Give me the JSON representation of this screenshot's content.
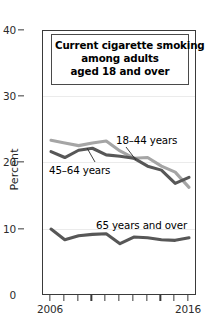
{
  "chart_data": {
    "type": "line",
    "title": "Current cigarette smoking among adults aged 18 and over",
    "title_lines": [
      "Current cigarette smoking",
      "among adults",
      "aged 18 and over"
    ],
    "xlabel": "",
    "ylabel": "Percent",
    "x": [
      2006,
      2007,
      2008,
      2009,
      2010,
      2011,
      2012,
      2013,
      2014,
      2015,
      2016
    ],
    "xlim": [
      2006,
      2016
    ],
    "ylim": [
      0,
      40
    ],
    "ytick_labels": [
      "0",
      "10",
      "20",
      "30",
      "40"
    ],
    "ytick_values": [
      0,
      10,
      20,
      30,
      40
    ],
    "xtick_values": [
      2006,
      2007,
      2008,
      2009,
      2010,
      2011,
      2012,
      2013,
      2014,
      2015,
      2016
    ],
    "xtick_labels_shown": [
      "2006",
      "2016"
    ],
    "grid": true,
    "legend_position": "inline-annotations",
    "series": [
      {
        "name": "18-44 years",
        "label": "18–44 years",
        "color": "#a5a5a5",
        "values": [
          23.5,
          23.1,
          22.7,
          23.1,
          23.4,
          21.9,
          20.8,
          20.9,
          19.6,
          18.7,
          16.4
        ]
      },
      {
        "name": "45-64 years",
        "label": "45–64 years",
        "color": "#575757",
        "values": [
          21.8,
          20.9,
          22.0,
          22.3,
          21.3,
          21.1,
          20.8,
          19.6,
          19.0,
          17.0,
          17.9
        ]
      },
      {
        "name": "65 years and over",
        "label": "65 years and over",
        "color": "#575757",
        "values": [
          10.1,
          8.5,
          9.1,
          9.3,
          9.4,
          7.9,
          8.9,
          8.8,
          8.5,
          8.4,
          8.8
        ]
      }
    ]
  },
  "axes": {
    "y_title": "Percent",
    "y_labels": [
      "40",
      "30",
      "20",
      "10",
      "0"
    ],
    "x_label_start": "2006",
    "x_label_end": "2016"
  },
  "annotations": {
    "series_18_44": "18–44 years",
    "series_45_64": "45–64 years",
    "series_65_over": "65 years and over"
  },
  "colors": {
    "light_gray": "#a5a5a5",
    "dark_gray": "#575757",
    "frame": "#3a3a3a",
    "grid": "#ebebeb",
    "text": "#000000"
  }
}
